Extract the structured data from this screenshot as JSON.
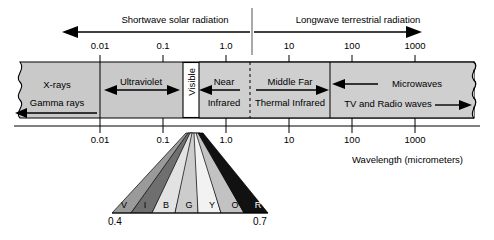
{
  "figure": {
    "title_top_left": "Shortwave solar radiation",
    "title_top_right": "Longwave terrestrial radiation",
    "caption": "Wavelength (micrometers)"
  },
  "axis": {
    "label": "Wavelength (micrometers)",
    "ticks": [
      "0.01",
      "0.1",
      "1.0",
      "10",
      "100",
      "1000"
    ],
    "tick_values": [
      0.01,
      0.1,
      1.0,
      10,
      100,
      1000
    ],
    "scale": "log"
  },
  "spectrum_bands": [
    {
      "name": "x-rays",
      "label": "X-rays",
      "sublabel": "Gamma rays",
      "fill": "#c9c9c9"
    },
    {
      "name": "ultraviolet",
      "label": "Ultraviolet",
      "sublabel": "",
      "fill": "#c9c9c9"
    },
    {
      "name": "visible",
      "label": "Visible",
      "sublabel": "",
      "fill": "#ffffff"
    },
    {
      "name": "near-infrared",
      "label": "Near",
      "sublabel": "Infrared",
      "fill": "#cfcfcf"
    },
    {
      "name": "thermal-infrared",
      "label": "Middle Far",
      "sublabel": "Thermal Infrared",
      "fill": "#cfcfcf"
    },
    {
      "name": "microwaves-radio",
      "label": "Microwaves",
      "sublabel": "TV and Radio waves",
      "fill": "#c9c9c9"
    }
  ],
  "visible_fan": {
    "letters": [
      "V",
      "I",
      "B",
      "G",
      "Y",
      "O",
      "R"
    ],
    "colors": [
      "#9a9a9a",
      "#6f6f6f",
      "#e2e2e2",
      "#cccccc",
      "#f2f2f2",
      "#c2c2c2",
      "#111111"
    ],
    "start_label": "0.4",
    "end_label": "0.7"
  },
  "colors": {
    "band_fill": "#c9c9c9",
    "band_fill_alt": "#cfcfcf",
    "stroke": "#000000",
    "background": "#ffffff"
  }
}
